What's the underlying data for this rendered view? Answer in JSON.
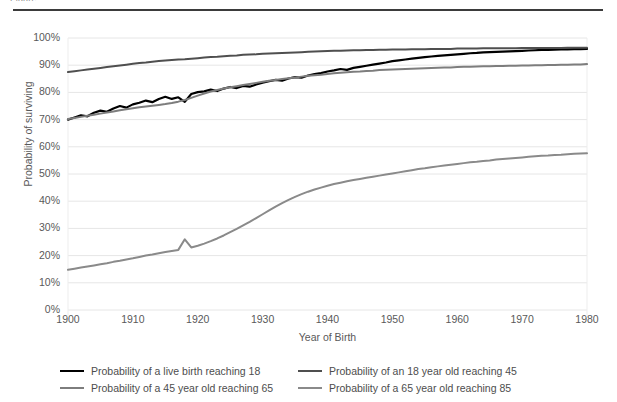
{
  "caption_fragment": "Figure",
  "chart_data": {
    "type": "line",
    "title": "",
    "xlabel": "Year of Birth",
    "ylabel": "Probability of surviving",
    "xlim": [
      1900,
      1980
    ],
    "ylim": [
      0,
      1
    ],
    "grid": true,
    "legend_position": "bottom",
    "xticks": [
      "1900",
      "1910",
      "1920",
      "1930",
      "1940",
      "1950",
      "1960",
      "1970",
      "1980"
    ],
    "xtick_values": [
      1900,
      1910,
      1920,
      1930,
      1940,
      1950,
      1960,
      1970,
      1980
    ],
    "yticks": [
      "0%",
      "10%",
      "20%",
      "30%",
      "40%",
      "50%",
      "60%",
      "70%",
      "80%",
      "90%",
      "100%"
    ],
    "ytick_values": [
      0,
      10,
      20,
      30,
      40,
      50,
      60,
      70,
      80,
      90,
      100
    ],
    "x": [
      1900,
      1901,
      1902,
      1903,
      1904,
      1905,
      1906,
      1907,
      1908,
      1909,
      1910,
      1911,
      1912,
      1913,
      1914,
      1915,
      1916,
      1917,
      1918,
      1919,
      1920,
      1921,
      1922,
      1923,
      1924,
      1925,
      1926,
      1927,
      1928,
      1929,
      1930,
      1931,
      1932,
      1933,
      1934,
      1935,
      1936,
      1937,
      1938,
      1939,
      1940,
      1941,
      1942,
      1943,
      1944,
      1945,
      1946,
      1947,
      1948,
      1949,
      1950,
      1951,
      1952,
      1953,
      1954,
      1955,
      1956,
      1957,
      1958,
      1959,
      1960,
      1961,
      1962,
      1963,
      1964,
      1965,
      1966,
      1967,
      1968,
      1969,
      1970,
      1971,
      1972,
      1973,
      1974,
      1975,
      1976,
      1977,
      1978,
      1979,
      1980
    ],
    "series": [
      {
        "name": "Probability of a live birth reaching 18",
        "color": "#000000",
        "width": 2.2,
        "values": [
          70.0,
          70.8,
          71.6,
          71.2,
          72.5,
          73.3,
          72.9,
          74.1,
          75.0,
          74.4,
          75.6,
          76.2,
          77.0,
          76.4,
          77.6,
          78.4,
          77.6,
          78.2,
          76.5,
          79.4,
          80.1,
          80.4,
          81.0,
          80.5,
          81.4,
          82.0,
          81.6,
          82.4,
          82.1,
          82.9,
          83.6,
          84.1,
          84.6,
          84.3,
          85.1,
          85.6,
          85.4,
          86.2,
          86.7,
          87.1,
          87.7,
          88.1,
          88.6,
          88.3,
          89.0,
          89.4,
          89.8,
          90.2,
          90.6,
          91.0,
          91.5,
          91.8,
          92.1,
          92.4,
          92.7,
          93.0,
          93.2,
          93.4,
          93.6,
          93.8,
          94.0,
          94.2,
          94.4,
          94.5,
          94.7,
          94.8,
          94.9,
          95.0,
          95.1,
          95.2,
          95.3,
          95.4,
          95.5,
          95.6,
          95.6,
          95.7,
          95.8,
          95.8,
          95.9,
          95.9,
          96.0
        ]
      },
      {
        "name": "Probability of an 18 year old reaching 45",
        "color": "#4f4f4f",
        "width": 2.0,
        "values": [
          87.5,
          87.8,
          88.1,
          88.4,
          88.7,
          89.0,
          89.3,
          89.6,
          89.9,
          90.2,
          90.5,
          90.8,
          91.0,
          91.3,
          91.5,
          91.7,
          91.9,
          92.1,
          92.2,
          92.4,
          92.6,
          92.8,
          93.0,
          93.1,
          93.3,
          93.5,
          93.6,
          93.8,
          93.9,
          94.0,
          94.2,
          94.3,
          94.4,
          94.5,
          94.6,
          94.7,
          94.8,
          94.9,
          95.0,
          95.1,
          95.2,
          95.3,
          95.3,
          95.4,
          95.5,
          95.5,
          95.6,
          95.6,
          95.7,
          95.7,
          95.8,
          95.8,
          95.8,
          95.9,
          95.9,
          95.9,
          96.0,
          96.0,
          96.0,
          96.0,
          96.1,
          96.1,
          96.1,
          96.1,
          96.2,
          96.2,
          96.2,
          96.2,
          96.2,
          96.2,
          96.3,
          96.3,
          96.3,
          96.3,
          96.3,
          96.3,
          96.3,
          96.4,
          96.4,
          96.4,
          96.4
        ]
      },
      {
        "name": "Probability of a 45 year old reaching 65",
        "color": "#7d7d7d",
        "width": 2.0,
        "values": [
          70.2,
          70.6,
          71.0,
          71.4,
          71.8,
          72.2,
          72.6,
          73.0,
          73.4,
          73.8,
          74.2,
          74.5,
          74.8,
          75.1,
          75.4,
          75.7,
          76.1,
          76.6,
          77.2,
          78.0,
          78.8,
          79.6,
          80.3,
          80.9,
          81.4,
          81.9,
          82.3,
          82.7,
          83.1,
          83.5,
          83.9,
          84.3,
          84.6,
          84.9,
          85.2,
          85.5,
          85.8,
          86.1,
          86.3,
          86.5,
          86.8,
          87.0,
          87.2,
          87.4,
          87.6,
          87.7,
          87.9,
          88.0,
          88.2,
          88.3,
          88.4,
          88.5,
          88.6,
          88.7,
          88.8,
          88.9,
          89.0,
          89.1,
          89.2,
          89.2,
          89.3,
          89.4,
          89.4,
          89.5,
          89.6,
          89.6,
          89.7,
          89.7,
          89.8,
          89.8,
          89.9,
          89.9,
          90.0,
          90.0,
          90.1,
          90.1,
          90.2,
          90.2,
          90.3,
          90.3,
          90.4
        ]
      },
      {
        "name": "Probability of a 65 year old reaching 85",
        "color": "#8a8a8a",
        "width": 2.0,
        "values": [
          14.8,
          15.2,
          15.6,
          16.0,
          16.4,
          16.8,
          17.2,
          17.7,
          18.1,
          18.6,
          19.0,
          19.5,
          20.0,
          20.4,
          20.9,
          21.3,
          21.7,
          22.1,
          26.0,
          23.0,
          23.6,
          24.4,
          25.3,
          26.3,
          27.4,
          28.6,
          29.8,
          31.1,
          32.4,
          33.8,
          35.2,
          36.6,
          38.0,
          39.3,
          40.5,
          41.6,
          42.6,
          43.5,
          44.3,
          45.0,
          45.7,
          46.3,
          46.8,
          47.3,
          47.8,
          48.2,
          48.6,
          49.0,
          49.4,
          49.8,
          50.2,
          50.6,
          51.0,
          51.4,
          51.8,
          52.1,
          52.5,
          52.8,
          53.1,
          53.4,
          53.7,
          54.0,
          54.3,
          54.5,
          54.8,
          55.0,
          55.3,
          55.5,
          55.7,
          55.9,
          56.1,
          56.3,
          56.5,
          56.7,
          56.8,
          57.0,
          57.1,
          57.3,
          57.4,
          57.5,
          57.6
        ]
      }
    ]
  },
  "legend": {
    "rows": [
      [
        {
          "label": "Probability of a live birth reaching 18",
          "color": "#000000"
        },
        {
          "label": "Probability of an 18 year old reaching 45",
          "color": "#4f4f4f"
        }
      ],
      [
        {
          "label": "Probability of a 45 year old reaching 65",
          "color": "#7d7d7d"
        },
        {
          "label": "Probability of a 65 year old reaching 85",
          "color": "#8a8a8a"
        }
      ]
    ]
  },
  "colors": {
    "gridline": "#e6e6e6",
    "axis_text": "#595959",
    "rule": "#3b3b3b",
    "background": "#ffffff"
  }
}
